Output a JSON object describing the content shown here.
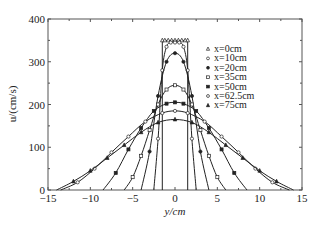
{
  "chart_data": {
    "type": "line",
    "title": "",
    "xlabel": "y/cm",
    "ylabel": "u/(cm/s)",
    "xlim": [
      -15,
      15
    ],
    "ylim": [
      0,
      400
    ],
    "xticks": [
      -15,
      -10,
      -5,
      0,
      5,
      10,
      15
    ],
    "yticks": [
      0,
      100,
      200,
      300,
      400
    ],
    "grid": false,
    "legend_position": "upper right (inside)",
    "series": [
      {
        "name": "x=0cm",
        "marker": "triangle-open",
        "peak": 350,
        "half_width": 1.5,
        "shape": "top-hat",
        "x": [
          -1.5,
          -1.5,
          -1.2,
          -0.8,
          -0.4,
          0,
          0.4,
          0.8,
          1.2,
          1.5,
          1.5
        ],
        "y": [
          0,
          350,
          350,
          350,
          350,
          350,
          350,
          350,
          350,
          350,
          0
        ]
      },
      {
        "name": "x=10cm",
        "marker": "circle-open",
        "peak": 345,
        "half_width": 2.5,
        "x": [
          -2.5,
          -2.0,
          -1.5,
          -1.0,
          -0.5,
          0,
          0.5,
          1.0,
          1.5,
          2.0,
          2.5
        ],
        "y": [
          0,
          120,
          280,
          335,
          345,
          345,
          345,
          335,
          280,
          120,
          0
        ]
      },
      {
        "name": "x=20cm",
        "marker": "circle-filled",
        "peak": 320,
        "half_width": 4,
        "x": [
          -4,
          -3,
          -2,
          -1,
          0,
          1,
          2,
          3,
          4
        ],
        "y": [
          0,
          90,
          220,
          300,
          320,
          300,
          220,
          90,
          0
        ]
      },
      {
        "name": "x=35cm",
        "marker": "square-open",
        "peak": 245,
        "half_width": 6,
        "x": [
          -6,
          -5,
          -4,
          -3,
          -2,
          -1,
          0,
          1,
          2,
          3,
          4,
          5,
          6
        ],
        "y": [
          0,
          30,
          80,
          140,
          200,
          235,
          245,
          235,
          200,
          140,
          80,
          30,
          0
        ]
      },
      {
        "name": "x=50cm",
        "marker": "square-filled",
        "peak": 205,
        "half_width": 8.5,
        "x": [
          -8.5,
          -7,
          -5.5,
          -4,
          -2.5,
          -1,
          0,
          1,
          2.5,
          4,
          5.5,
          7,
          8.5
        ],
        "y": [
          0,
          40,
          95,
          145,
          185,
          202,
          205,
          202,
          185,
          145,
          95,
          40,
          0
        ]
      },
      {
        "name": "x=62.5cm",
        "marker": "diamond-open",
        "peak": 185,
        "half_width": 13.5,
        "x": [
          -13.5,
          -11.5,
          -9.5,
          -7.5,
          -5.5,
          -3.5,
          -1.5,
          0,
          1.5,
          3.5,
          5.5,
          7.5,
          9.5,
          11.5,
          13.5
        ],
        "y": [
          0,
          18,
          50,
          88,
          125,
          160,
          180,
          185,
          180,
          160,
          125,
          88,
          50,
          18,
          0
        ]
      },
      {
        "name": "x=75cm",
        "marker": "triangle-filled",
        "peak": 165,
        "half_width": 14,
        "x": [
          -14,
          -12,
          -10,
          -8,
          -6,
          -4,
          -2,
          0,
          2,
          4,
          6,
          8,
          10,
          12,
          14
        ],
        "y": [
          0,
          20,
          45,
          75,
          105,
          135,
          158,
          165,
          158,
          135,
          105,
          75,
          45,
          20,
          0
        ]
      }
    ]
  },
  "legend": {
    "items": [
      {
        "label": "x=0cm",
        "marker": "triangle-open"
      },
      {
        "label": "x=10cm",
        "marker": "circle-open"
      },
      {
        "label": "x=20cm",
        "marker": "circle-filled"
      },
      {
        "label": "x=35cm",
        "marker": "square-open"
      },
      {
        "label": "x=50cm",
        "marker": "square-filled"
      },
      {
        "label": "x=62.5cm",
        "marker": "diamond-open"
      },
      {
        "label": "x=75cm",
        "marker": "triangle-filled"
      }
    ]
  },
  "axes": {
    "xlabel": "y/cm",
    "ylabel": "u/(cm/s)",
    "xtick_labels": [
      "−15",
      "−10",
      "−5",
      "0",
      "5",
      "10",
      "15"
    ],
    "ytick_labels": [
      "0",
      "100",
      "200",
      "300",
      "400"
    ]
  },
  "colors": {
    "line": "#222222",
    "frame": "#555555"
  }
}
